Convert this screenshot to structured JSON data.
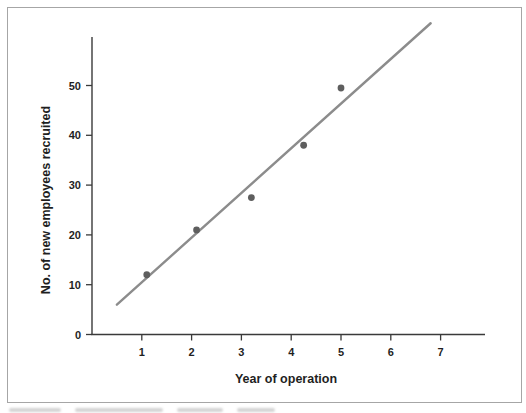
{
  "chart_data": {
    "type": "scatter",
    "title": "",
    "xlabel": "Year of operation",
    "ylabel": "No. of new employees recruited",
    "x_ticks": [
      1,
      2,
      3,
      4,
      5,
      6,
      7
    ],
    "y_ticks": [
      0,
      10,
      20,
      30,
      40,
      50
    ],
    "xlim": [
      0,
      7.9
    ],
    "ylim": [
      0,
      60
    ],
    "grid": false,
    "legend": "none",
    "points": [
      [
        1.1,
        12
      ],
      [
        2.1,
        21
      ],
      [
        3.2,
        27.5
      ],
      [
        4.25,
        38
      ],
      [
        5.0,
        49.5
      ]
    ],
    "trend_line": {
      "x1": 0.5,
      "y1": 6,
      "x2": 6.8,
      "y2": 62.5
    },
    "colors": {
      "point": "#5e5e5e",
      "trend_line": "#8c8c8c",
      "axis": "#3a3a3a",
      "tick_label": "#1f1f1f",
      "frame_border": "#a6a6a6"
    }
  }
}
